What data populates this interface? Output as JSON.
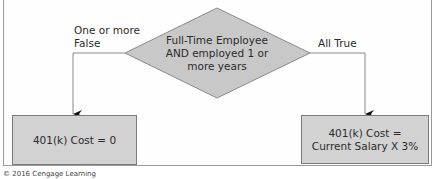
{
  "diagram": {
    "type": "flowchart",
    "decision": {
      "shape": "diamond",
      "lines": [
        "Full-Time Employee",
        "AND employed 1 or",
        "more years"
      ],
      "fill": "#c8c8c8"
    },
    "branches": {
      "left": {
        "label_lines": [
          "One or more",
          "False"
        ],
        "result": {
          "lines": [
            "401(k) Cost = 0"
          ]
        }
      },
      "right": {
        "label_lines": [
          "All True"
        ],
        "result": {
          "lines": [
            "401(k) Cost =",
            "Current Salary X 3%"
          ]
        }
      }
    },
    "box_fill": "#d2d2d2",
    "line_color": "#8a8a8a"
  },
  "caption": "© 2016 Cengage Learning"
}
